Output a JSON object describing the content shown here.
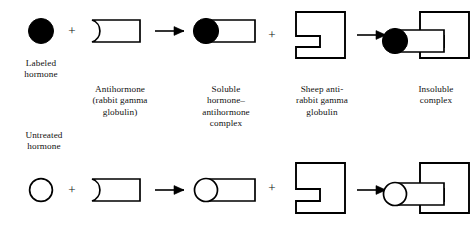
{
  "figure": {
    "background_color": "#ffffff",
    "stroke_color": "#000000",
    "fill_dark": "#000000",
    "fill_light": "#ffffff"
  },
  "operators": {
    "plus": "+",
    "arrow": "arrow-right"
  },
  "rows": [
    {
      "id": "labeled-row",
      "label_text": "Labeled\nhormone",
      "hormone_fill": "#000000"
    },
    {
      "id": "untreated-row",
      "label_text": "Untreated\nhormone",
      "hormone_fill": "#ffffff"
    }
  ],
  "captions": {
    "labeled_hormone": "Labeled\nhormone",
    "untreated_hormone": "Untreated\nhormone",
    "antihormone": "Antihormone\n(rabbit gamma\nglobulin)",
    "soluble_complex": "Soluble\nhormone–\nantihormone\ncomplex",
    "sheep_anti_rabbit": "Sheep anti-\nrabbit gamma\nglobulin",
    "insoluble_complex": "Insoluble\ncomplex"
  },
  "operator_symbols": {
    "plus_1": "+",
    "plus_2": "+",
    "plus_3": "+",
    "plus_4": "+"
  }
}
